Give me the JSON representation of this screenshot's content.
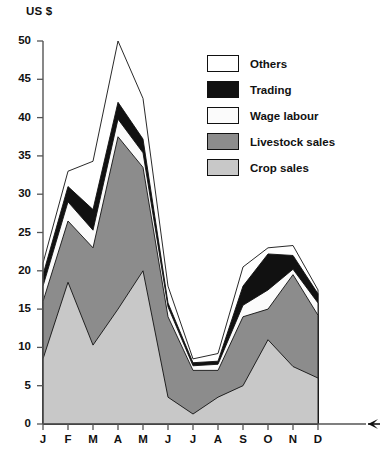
{
  "chart_data": {
    "type": "area",
    "stacked": true,
    "title": "",
    "subtitle": "",
    "xlabel": "",
    "ylabel": "US $",
    "ylim": [
      0,
      50
    ],
    "ytick_values": [
      0,
      5,
      10,
      15,
      20,
      25,
      30,
      35,
      40,
      45,
      50
    ],
    "grid": false,
    "legend_position": "inside-top-right",
    "axis_arrow": true,
    "categories": [
      "J",
      "F",
      "M",
      "A",
      "M",
      "J",
      "J",
      "A",
      "S",
      "O",
      "N",
      "D"
    ],
    "series": [
      {
        "name": "Crop sales",
        "color": "#c8c8c8",
        "values": [
          8.5,
          18.5,
          10.3,
          15.0,
          20.0,
          3.5,
          1.3,
          3.5,
          5.0,
          11.0,
          7.5,
          6.0
        ]
      },
      {
        "name": "Livestock sales",
        "color": "#8c8c8c",
        "values": [
          7.5,
          8.0,
          12.7,
          22.5,
          13.5,
          10.5,
          5.7,
          3.5,
          9.0,
          4.0,
          12.0,
          8.2
        ]
      },
      {
        "name": "Wage labour",
        "color": "#fbfbfb",
        "values": [
          2.0,
          2.5,
          2.3,
          2.3,
          1.9,
          1.3,
          0.6,
          0.8,
          1.5,
          2.5,
          0.7,
          1.6
        ]
      },
      {
        "name": "Trading",
        "color": "#111111",
        "values": [
          1.5,
          2.0,
          2.7,
          2.2,
          1.8,
          0.5,
          0.4,
          0.4,
          2.5,
          4.7,
          1.8,
          1.2
        ]
      },
      {
        "name": "Others",
        "color": "#ffffff",
        "values": [
          1.5,
          2.0,
          6.3,
          8.0,
          5.3,
          2.2,
          0.5,
          1.0,
          2.5,
          0.8,
          1.3,
          0.5
        ]
      }
    ],
    "cumulative_tops": {
      "crop_sales": [
        8.5,
        18.5,
        10.3,
        15.0,
        20.0,
        3.5,
        1.3,
        3.5,
        5.0,
        11.0,
        7.5,
        6.0
      ],
      "livestock_sales": [
        16.0,
        26.5,
        23.0,
        37.5,
        33.5,
        14.0,
        7.0,
        7.0,
        14.0,
        15.0,
        19.5,
        14.2
      ],
      "wage_labour": [
        18.0,
        29.0,
        25.3,
        39.8,
        35.4,
        15.3,
        7.6,
        7.8,
        15.5,
        17.5,
        20.2,
        15.8
      ],
      "trading": [
        19.5,
        31.0,
        28.0,
        42.0,
        37.2,
        15.8,
        8.0,
        8.2,
        18.0,
        22.2,
        22.0,
        17.0
      ],
      "others": [
        21.0,
        33.0,
        34.3,
        50.0,
        42.5,
        18.0,
        8.5,
        9.2,
        20.5,
        23.0,
        23.3,
        17.5
      ]
    }
  },
  "axis": {
    "unit_label": "US $",
    "y_ticks": [
      "50",
      "45",
      "40",
      "35",
      "30",
      "25",
      "20",
      "15",
      "10",
      "5",
      "0"
    ],
    "x_ticks": [
      "J",
      "F",
      "M",
      "A",
      "M",
      "J",
      "J",
      "A",
      "S",
      "O",
      "N",
      "D"
    ]
  },
  "legend": {
    "items": [
      {
        "label": "Others",
        "color": "#ffffff"
      },
      {
        "label": "Trading",
        "color": "#111111"
      },
      {
        "label": "Wage labour",
        "color": "#fbfbfb"
      },
      {
        "label": "Livestock sales",
        "color": "#8c8c8c"
      },
      {
        "label": "Crop sales",
        "color": "#c8c8c8"
      }
    ]
  }
}
